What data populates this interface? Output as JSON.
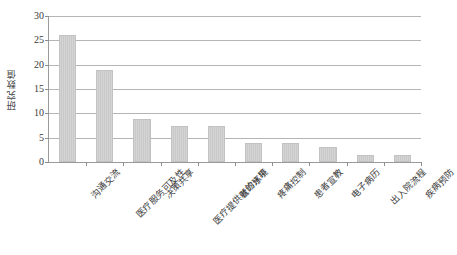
{
  "chart_data": {
    "type": "bar",
    "title": "",
    "xlabel": "",
    "ylabel": "研究数值",
    "ylim": [
      0,
      30
    ],
    "yticks": [
      0,
      5,
      10,
      15,
      20,
      25,
      30
    ],
    "grid": true,
    "legend": "none",
    "categories": [
      "沟通交流",
      "医疗服务可及性",
      "决策共享",
      "医疗提供者的水平",
      "就诊环境",
      "疼痛控制",
      "患者宣教",
      "电子病历",
      "出入院流程",
      "疾病预防"
    ],
    "values": [
      26,
      19,
      8.8,
      7.5,
      7.5,
      4,
      4,
      3,
      1.5,
      1.5
    ],
    "series": [
      {
        "name": "研究数值",
        "values": [
          26,
          19,
          8.8,
          7.5,
          7.5,
          4,
          4,
          3,
          1.5,
          1.5
        ]
      }
    ],
    "colors": {
      "bar_fill": "#d0d0d0",
      "bar_stroke": "#c2c2c2",
      "gridline": "#b5b5b5",
      "axis": "#9a9a9a",
      "text": "#3a3a3a",
      "background": "#ffffff"
    }
  }
}
